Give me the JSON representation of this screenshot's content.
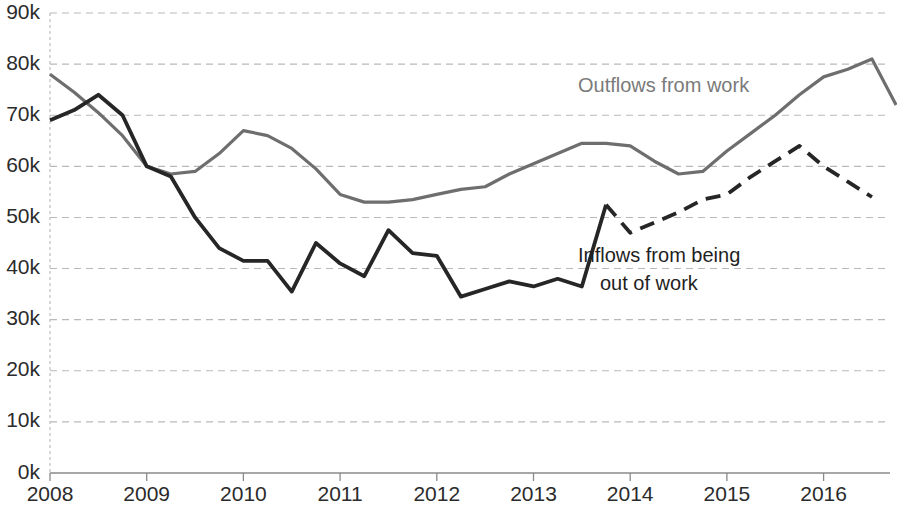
{
  "chart_data": {
    "type": "line",
    "title": "",
    "subtitle": "",
    "xlabel": "",
    "ylabel": "",
    "ylim": [
      0,
      90000
    ],
    "xlim": [
      2008,
      2016.75
    ],
    "grid": true,
    "gridlines_style": "dashed horizontal",
    "legend_position": "inline annotations",
    "y_tick_labels": [
      "0k",
      "10k",
      "20k",
      "30k",
      "40k",
      "50k",
      "60k",
      "70k",
      "80k",
      "90k"
    ],
    "y_tick_values": [
      0,
      10000,
      20000,
      30000,
      40000,
      50000,
      60000,
      70000,
      80000,
      90000
    ],
    "x_tick_labels": [
      "2008",
      "2009",
      "2010",
      "2011",
      "2012",
      "2013",
      "2014",
      "2015",
      "2016"
    ],
    "x_tick_values": [
      2008,
      2009,
      2010,
      2011,
      2012,
      2013,
      2014,
      2015,
      2016
    ],
    "x_frequency": "quarterly",
    "x": [
      2008.0,
      2008.25,
      2008.5,
      2008.75,
      2009.0,
      2009.25,
      2009.5,
      2009.75,
      2010.0,
      2010.25,
      2010.5,
      2010.75,
      2011.0,
      2011.25,
      2011.5,
      2011.75,
      2012.0,
      2012.25,
      2012.5,
      2012.75,
      2013.0,
      2013.25,
      2013.5,
      2013.75,
      2014.0,
      2014.25,
      2014.5,
      2014.75,
      2015.0,
      2015.25,
      2015.5,
      2015.75,
      2016.0,
      2016.25,
      2016.5
    ],
    "series": [
      {
        "name": "Outflows from work",
        "color": "#6e6e6e",
        "style": "solid",
        "values": [
          78000,
          74500,
          70500,
          66000,
          60000,
          58500,
          59000,
          62500,
          67000,
          66000,
          63500,
          59500,
          54500,
          53000,
          53000,
          53500,
          54500,
          55500,
          56000,
          58500,
          60500,
          62500,
          64500,
          64500,
          64000,
          61000,
          58500,
          59000,
          63000,
          66500,
          70000,
          74000,
          77500,
          79000,
          81000
        ],
        "last_value": 72000
      },
      {
        "name": "Inflows from being out of work",
        "color": "#262626",
        "style": "solid then dashed",
        "dash_starts_at": 2013.75,
        "values": [
          69000,
          71000,
          74000,
          70000,
          60000,
          58000,
          50000,
          44000,
          41500,
          41500,
          35500,
          45000,
          41000,
          38500,
          47500,
          43000,
          42500,
          34500,
          36000,
          37500,
          36500,
          38000,
          36500,
          52500,
          47000,
          49000,
          51000,
          53500,
          54500,
          58000,
          61000,
          64000,
          60000,
          57000,
          54000
        ]
      }
    ],
    "annotations": [
      {
        "id": "outflows-label",
        "text": "Outflows from work",
        "color": "#7a7a7a",
        "x_px": 578,
        "y_px": 92
      },
      {
        "id": "inflows-label-line1",
        "text": "Inflows from being",
        "color": "#1f1f1f",
        "x_px": 578,
        "y_px": 262
      },
      {
        "id": "inflows-label-line2",
        "text": "out of work",
        "color": "#1f1f1f",
        "x_px": 600,
        "y_px": 290
      }
    ]
  },
  "annotations": {
    "outflows_label": "Outflows from work",
    "inflows_label_line1": "Inflows from being",
    "inflows_label_line2": "out of work"
  },
  "axes": {
    "y_labels": [
      "90k",
      "80k",
      "70k",
      "60k",
      "50k",
      "40k",
      "30k",
      "20k",
      "10k",
      "0k"
    ],
    "x_labels": [
      "2008",
      "2009",
      "2010",
      "2011",
      "2012",
      "2013",
      "2014",
      "2015",
      "2016"
    ]
  },
  "colors": {
    "outflows_line": "#6e6e6e",
    "inflows_line": "#262626",
    "gridline": "#b9b9b9",
    "axis": "#8a8a8a",
    "text": "#2b2b2b",
    "background": "#ffffff"
  }
}
